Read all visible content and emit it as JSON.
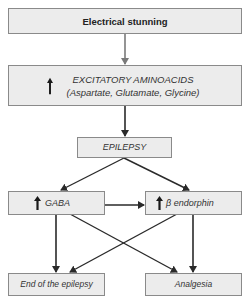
{
  "diagram": {
    "nodes": {
      "stunning": {
        "label": "Electrical stunning"
      },
      "excitatory": {
        "label": "EXCITATORY AMINOACIDS",
        "sublabel": "(Aspartate, Glutamate, Glycine)",
        "indicator": "increase"
      },
      "epilepsy": {
        "label": "EPILEPSY"
      },
      "gaba": {
        "label": "GABA",
        "indicator": "increase"
      },
      "endorphin": {
        "label": "β endorphin",
        "indicator": "increase"
      },
      "end_epilepsy": {
        "label": "End of the epilepsy"
      },
      "analgesia": {
        "label": "Analgesia"
      }
    },
    "edges": [
      {
        "from": "stunning",
        "to": "excitatory",
        "color": "#7a7a7a"
      },
      {
        "from": "excitatory",
        "to": "epilepsy",
        "color": "#2a2a2a"
      },
      {
        "from": "epilepsy",
        "to": "gaba",
        "color": "#2a2a2a"
      },
      {
        "from": "epilepsy",
        "to": "endorphin",
        "color": "#2a2a2a"
      },
      {
        "from": "gaba",
        "to": "endorphin",
        "color": "#2a2a2a"
      },
      {
        "from": "gaba",
        "to": "end_epilepsy",
        "color": "#2a2a2a"
      },
      {
        "from": "gaba",
        "to": "analgesia",
        "color": "#2a2a2a"
      },
      {
        "from": "endorphin",
        "to": "end_epilepsy",
        "color": "#2a2a2a"
      },
      {
        "from": "endorphin",
        "to": "analgesia",
        "color": "#2a2a2a"
      }
    ]
  }
}
